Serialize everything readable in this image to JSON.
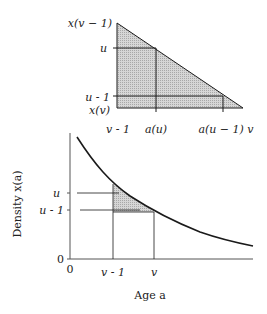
{
  "top_panel": {
    "y_labels": {
      "top": "x(v − 1)",
      "u": "u",
      "u_minus_1": "u - 1",
      "bottom": "x(v)"
    },
    "x_labels": {
      "left": "v - 1",
      "a_u": "a(u)",
      "a_u_minus_1": "a(u − 1) v"
    }
  },
  "bottom_panel": {
    "y_axis_label": "Density x(a)",
    "x_axis_label": "Age a",
    "y_ticks": {
      "u": "u",
      "u_minus_1": "u - 1",
      "zero": "0"
    },
    "x_ticks": {
      "zero": "0",
      "v_minus_1": "v - 1",
      "v": "v"
    }
  },
  "colors": {
    "line": "#1a1a1a",
    "fill": "#c8c8c8"
  }
}
